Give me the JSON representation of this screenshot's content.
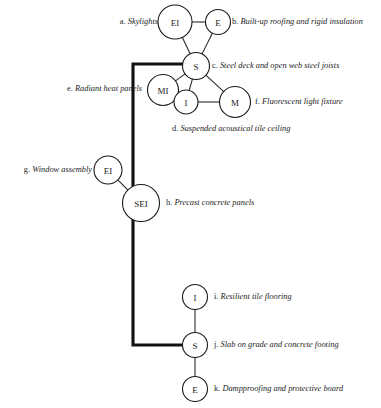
{
  "figure": {
    "type": "node-link-diagram",
    "background_color": "#ffffff",
    "node_stroke_color": "#1a1a1a",
    "thin_edge_color": "#2b2b2b",
    "thick_edge_color": "#111111"
  },
  "nodes": [
    {
      "id": "n_ei_top",
      "label": "EI",
      "cx": 175,
      "cy": 22,
      "r": 17
    },
    {
      "id": "n_e_top",
      "label": "E",
      "cx": 218,
      "cy": 22,
      "r": 12.5
    },
    {
      "id": "n_s_top",
      "label": "S",
      "cx": 196,
      "cy": 66,
      "r": 13.5
    },
    {
      "id": "n_mi",
      "label": "MI",
      "cx": 163,
      "cy": 90,
      "r": 15.5
    },
    {
      "id": "n_i_mid",
      "label": "I",
      "cx": 186,
      "cy": 102,
      "r": 12
    },
    {
      "id": "n_m",
      "label": "M",
      "cx": 235,
      "cy": 102,
      "r": 15.5
    },
    {
      "id": "n_ei_mid",
      "label": "EI",
      "cx": 108,
      "cy": 170,
      "r": 14
    },
    {
      "id": "n_sei",
      "label": "SEI",
      "cx": 141,
      "cy": 203,
      "r": 18.5
    },
    {
      "id": "n_i_bot",
      "label": "I",
      "cx": 195,
      "cy": 297,
      "r": 12.5
    },
    {
      "id": "n_s_bot",
      "label": "S",
      "cx": 195,
      "cy": 345,
      "r": 12.5
    },
    {
      "id": "n_e_bot",
      "label": "E",
      "cx": 195,
      "cy": 389,
      "r": 12.5
    }
  ],
  "thin_edges": [
    {
      "from": "n_ei_top",
      "to": "n_e_top"
    },
    {
      "from": "n_ei_top",
      "to": "n_s_top"
    },
    {
      "from": "n_e_top",
      "to": "n_s_top"
    },
    {
      "from": "n_s_top",
      "to": "n_mi"
    },
    {
      "from": "n_s_top",
      "to": "n_i_mid"
    },
    {
      "from": "n_s_top",
      "to": "n_m"
    },
    {
      "from": "n_mi",
      "to": "n_i_mid"
    },
    {
      "from": "n_i_mid",
      "to": "n_m"
    },
    {
      "from": "n_ei_mid",
      "to": "n_sei"
    },
    {
      "from": "n_i_bot",
      "to": "n_s_bot"
    },
    {
      "from": "n_s_bot",
      "to": "n_e_bot"
    }
  ],
  "thick_path": {
    "description": "heavy structural spine from S node left, down past SEI, then right to lower S node",
    "points": "183,64 133,64 133,345 183,345"
  },
  "callouts": [
    {
      "key": "a",
      "letter": "a.",
      "text": "Skylights",
      "side": "left",
      "x": 110,
      "y": 17,
      "width": 48
    },
    {
      "key": "b",
      "letter": "b.",
      "text": "Built-up roofing and rigid insulation",
      "side": "right",
      "x": 232,
      "y": 17,
      "width": 150
    },
    {
      "key": "c",
      "letter": "c.",
      "text": "Steel deck and open web steel joists",
      "side": "right",
      "x": 212,
      "y": 61,
      "width": 150
    },
    {
      "key": "d",
      "letter": "d.",
      "text": "Suspended acoustical tile ceiling",
      "side": "right",
      "x": 172,
      "y": 124,
      "width": 160
    },
    {
      "key": "e",
      "letter": "e.",
      "text": "Radiant heat panels",
      "side": "left",
      "x": 48,
      "y": 84,
      "width": 94
    },
    {
      "key": "f",
      "letter": "f.",
      "text": "Fluorescent light fixture",
      "side": "right",
      "x": 255,
      "y": 97,
      "width": 110
    },
    {
      "key": "g",
      "letter": "g.",
      "text": "Window assembly",
      "side": "left",
      "x": 12,
      "y": 165,
      "width": 80
    },
    {
      "key": "h",
      "letter": "h.",
      "text": "Precast concrete panels",
      "side": "right",
      "x": 166,
      "y": 198,
      "width": 110
    },
    {
      "key": "i",
      "letter": "i.",
      "text": "Resilient tile flooring",
      "side": "right",
      "x": 214,
      "y": 292,
      "width": 100
    },
    {
      "key": "j",
      "letter": "j.",
      "text": "Slab on grade and concrete footing",
      "side": "right",
      "x": 214,
      "y": 340,
      "width": 150
    },
    {
      "key": "k",
      "letter": "k.",
      "text": "Dampproofing and protective board",
      "side": "right",
      "x": 214,
      "y": 384,
      "width": 160
    }
  ]
}
